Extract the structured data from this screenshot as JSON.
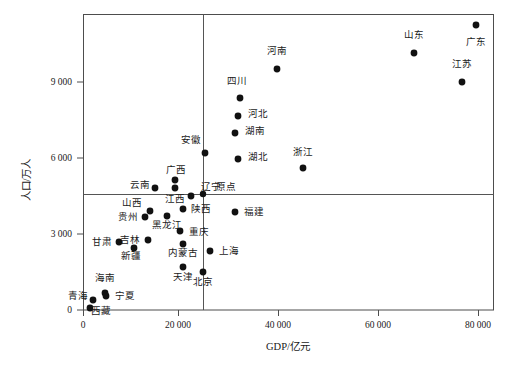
{
  "chart_data": {
    "type": "scatter",
    "title": "",
    "xlabel": "GDP/亿元",
    "ylabel": "人口/万人",
    "xlim": [
      -4000,
      86500
    ],
    "ylim": [
      -500,
      11500
    ],
    "xticks": [
      0,
      20000,
      40000,
      60000,
      80000
    ],
    "xticklabels": [
      "0",
      "20 000",
      "40 000",
      "60 000",
      "80 000"
    ],
    "yticks": [
      0,
      3000,
      6000,
      9000
    ],
    "yticklabels": [
      "0",
      "3 000",
      "6 000",
      "9 000"
    ],
    "grid": false,
    "legend": null,
    "reference_lines": {
      "vertical_x": 25000,
      "horizontal_y": 4600,
      "origin_label": "原点"
    },
    "points": [
      {
        "label": "广东",
        "x": 82600,
        "y": 10800,
        "lx": 476,
        "ly": 25,
        "tx": 476,
        "ty": 45,
        "anchor": "middle"
      },
      {
        "label": "山东",
        "x": 69000,
        "y": 9700,
        "lx": 414,
        "ly": 53,
        "tx": 414,
        "ty": 38,
        "anchor": "middle"
      },
      {
        "label": "河南",
        "x": 40500,
        "y": 9400,
        "lx": 277,
        "ly": 69,
        "tx": 277,
        "ty": 54,
        "anchor": "middle"
      },
      {
        "label": "江苏",
        "x": 76500,
        "y": 8100,
        "lx": 462,
        "ly": 82,
        "tx": 462,
        "ty": 67,
        "anchor": "middle"
      },
      {
        "label": "四川",
        "x": 33000,
        "y": 8200,
        "lx": 240,
        "ly": 98,
        "tx": 237,
        "ty": 84,
        "anchor": "middle"
      },
      {
        "label": "河北",
        "x": 32800,
        "y": 7000,
        "lx": 238,
        "ly": 116,
        "tx": 248,
        "ty": 117,
        "anchor": "start"
      },
      {
        "label": "湖南",
        "x": 31500,
        "y": 6400,
        "lx": 235,
        "ly": 133,
        "tx": 245,
        "ty": 134,
        "anchor": "start"
      },
      {
        "label": "安徽",
        "x": 25500,
        "y": 6100,
        "lx": 205,
        "ly": 153,
        "tx": 201,
        "ty": 143,
        "anchor": "end"
      },
      {
        "label": "湖北",
        "x": 32500,
        "y": 5900,
        "lx": 238,
        "ly": 159,
        "tx": 248,
        "ty": 160,
        "anchor": "start"
      },
      {
        "label": "浙江",
        "x": 46000,
        "y": 5500,
        "lx": 303,
        "ly": 168,
        "tx": 303,
        "ty": 155,
        "anchor": "middle"
      },
      {
        "label": "广西",
        "x": 19300,
        "y": 4800,
        "lx": 175,
        "ly": 180,
        "tx": 176,
        "ty": 173,
        "anchor": "middle"
      },
      {
        "label": "云南",
        "x": 15200,
        "y": 4600,
        "lx": 155,
        "ly": 188,
        "tx": 150,
        "ty": 188,
        "anchor": "end"
      },
      {
        "label": "江西",
        "x": 19300,
        "y": 4450,
        "lx": 175,
        "ly": 188,
        "tx": 175,
        "ty": 202,
        "anchor": "middle"
      },
      {
        "label": "辽宁",
        "x": 22600,
        "y": 4300,
        "lx": 191,
        "ly": 196,
        "tx": 201,
        "ty": 190,
        "anchor": "start"
      },
      {
        "label": "原点",
        "x": 25000,
        "y": 4600,
        "lx": 203,
        "ly": 194,
        "tx": 216,
        "ty": 190,
        "anchor": "start"
      },
      {
        "label": "陕西",
        "x": 20900,
        "y": 3750,
        "lx": 183,
        "ly": 209,
        "tx": 191,
        "ty": 212,
        "anchor": "start"
      },
      {
        "label": "山西",
        "x": 14000,
        "y": 3600,
        "lx": 150,
        "ly": 211,
        "tx": 142,
        "ty": 206,
        "anchor": "end"
      },
      {
        "label": "福建",
        "x": 31500,
        "y": 3700,
        "lx": 235,
        "ly": 212,
        "tx": 244,
        "ty": 215,
        "anchor": "start"
      },
      {
        "label": "黑龙江",
        "x": 17500,
        "y": 3450,
        "lx": 167,
        "ly": 216,
        "tx": 167,
        "ty": 228,
        "anchor": "middle"
      },
      {
        "label": "贵州",
        "x": 13200,
        "y": 3400,
        "lx": 145,
        "ly": 217,
        "tx": 138,
        "ty": 220,
        "anchor": "end"
      },
      {
        "label": "重庆",
        "x": 20000,
        "y": 3000,
        "lx": 180,
        "ly": 231,
        "tx": 189,
        "ty": 235,
        "anchor": "start"
      },
      {
        "label": "吉林",
        "x": 13800,
        "y": 2750,
        "lx": 148,
        "ly": 240,
        "tx": 140,
        "ty": 243,
        "anchor": "end"
      },
      {
        "label": "甘肃",
        "x": 8000,
        "y": 2600,
        "lx": 119,
        "ly": 242,
        "tx": 112,
        "ty": 245,
        "anchor": "end"
      },
      {
        "label": "内蒙古",
        "x": 20500,
        "y": 2500,
        "lx": 183,
        "ly": 244,
        "tx": 183,
        "ty": 256,
        "anchor": "middle"
      },
      {
        "label": "新疆",
        "x": 11200,
        "y": 2300,
        "lx": 134,
        "ly": 248,
        "tx": 131,
        "ty": 259,
        "anchor": "middle"
      },
      {
        "label": "上海",
        "x": 26500,
        "y": 2400,
        "lx": 210,
        "ly": 251,
        "tx": 219,
        "ty": 254,
        "anchor": "start"
      },
      {
        "label": "天津",
        "x": 20500,
        "y": 1500,
        "lx": 183,
        "ly": 267,
        "tx": 183,
        "ty": 280,
        "anchor": "middle"
      },
      {
        "label": "北京",
        "x": 25000,
        "y": 2000,
        "lx": 203,
        "ly": 272,
        "tx": 203,
        "ty": 285,
        "anchor": "middle"
      },
      {
        "label": "海南",
        "x": 5000,
        "y": 900,
        "lx": 105,
        "ly": 293,
        "tx": 105,
        "ty": 281,
        "anchor": "middle"
      },
      {
        "label": "宁夏",
        "x": 5500,
        "y": 800,
        "lx": 106,
        "ly": 296,
        "tx": 115,
        "ty": 299,
        "anchor": "start"
      },
      {
        "label": "青海",
        "x": 3200,
        "y": 700,
        "lx": 93,
        "ly": 300,
        "tx": 88,
        "ty": 299,
        "anchor": "end"
      },
      {
        "label": "西藏",
        "x": 2500,
        "y": 300,
        "lx": 90,
        "ly": 308,
        "tx": 101,
        "ty": 314,
        "anchor": "middle"
      }
    ]
  },
  "plot_geometry": {
    "frame": {
      "left": 83,
      "top": 14,
      "right": 494,
      "bottom": 310
    },
    "x_tick_px": [
      83,
      178,
      278,
      378,
      478
    ],
    "y_tick_px": [
      310,
      234,
      158,
      82
    ],
    "vline_px": 203,
    "hline_px": 194
  },
  "colors": {
    "point": "#111111",
    "axis": "#4d4d4d",
    "reference_line": "#555555",
    "text": "#1a1a1a",
    "background": "#ffffff"
  }
}
